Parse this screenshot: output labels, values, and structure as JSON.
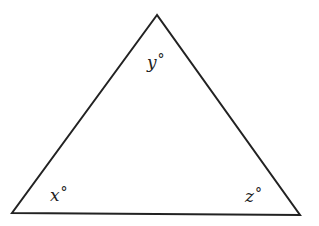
{
  "diagram": {
    "type": "triangle",
    "stroke_color": "#222222",
    "background_color": "#ffffff",
    "vertices": {
      "top": {
        "x": 157,
        "y": 15
      },
      "bottom_left": {
        "x": 12,
        "y": 213
      },
      "bottom_right": {
        "x": 300,
        "y": 215
      }
    },
    "labels": {
      "top": {
        "variable": "y",
        "unit": "°"
      },
      "bottom_left": {
        "variable": "x",
        "unit": "°"
      },
      "bottom_right": {
        "variable": "z",
        "unit": "°"
      }
    }
  }
}
